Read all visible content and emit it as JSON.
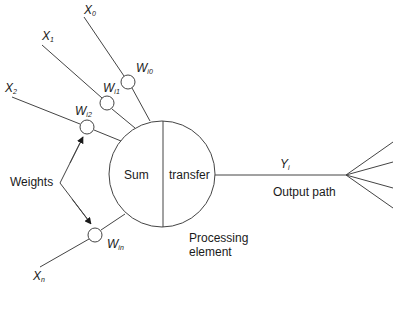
{
  "diagram": {
    "type": "artificial-neuron",
    "inputs": [
      {
        "label": "X",
        "subscript": "0",
        "weight_label": "W",
        "weight_subscript": "i0"
      },
      {
        "label": "X",
        "subscript": "1",
        "weight_label": "W",
        "weight_subscript": "i1"
      },
      {
        "label": "X",
        "subscript": "2",
        "weight_label": "W",
        "weight_subscript": "i2"
      },
      {
        "label": "X",
        "subscript": "n",
        "weight_label": "W",
        "weight_subscript": "in"
      }
    ],
    "weights_annotation": "Weights",
    "processing_element": {
      "left_label": "Sum",
      "right_label": "transfer",
      "caption_line1": "Processing",
      "caption_line2": "element"
    },
    "output": {
      "label": "Y",
      "subscript": "i",
      "path_label": "Output path",
      "fanout_branches": 4
    }
  },
  "colors": {
    "stroke": "#444444",
    "text": "#1a1a1a",
    "background": "#ffffff"
  }
}
